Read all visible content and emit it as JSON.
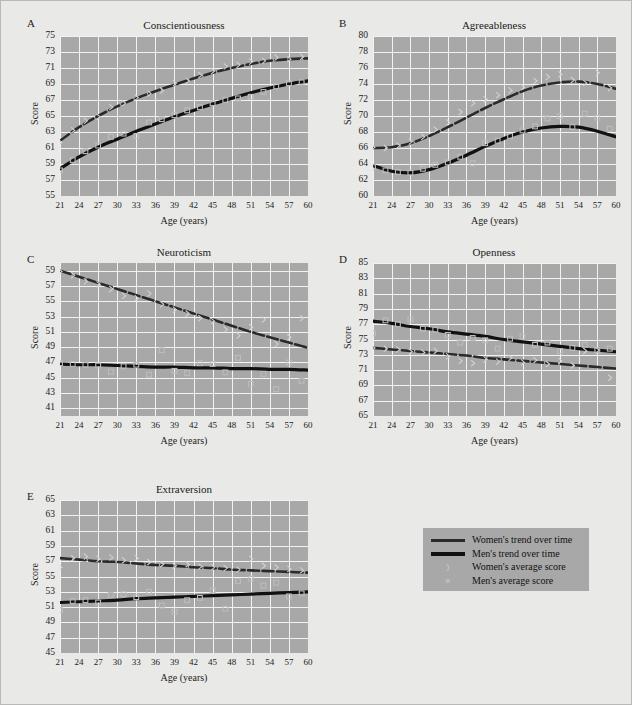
{
  "figure": {
    "background_color": "#e9e9e7",
    "plot_background_color": "#a8a8a8",
    "grid_color": "#f2f2f0",
    "women_color": "#2a2a2a",
    "men_color": "#111111",
    "women_marker_color": "#d2d2d2",
    "men_marker_color": "#bcbcbc"
  },
  "axis_titles": {
    "y": "Score",
    "x": "Age (years)"
  },
  "legend": {
    "entries": [
      {
        "label": "Women's trend over time",
        "type": "line",
        "series": "women"
      },
      {
        "label": "Men's trend over time",
        "type": "line",
        "series": "men"
      },
      {
        "label": "Women's average score",
        "type": "marker",
        "series": "women",
        "glyph": "⟩"
      },
      {
        "label": "Men's average score",
        "type": "marker",
        "series": "men",
        "glyph": "■"
      }
    ]
  },
  "chart_data": [
    {
      "panel": "A",
      "type": "line",
      "title": "Conscientiousness",
      "xlabel": "Age (years)",
      "ylabel": "Score",
      "xlim": [
        21,
        60
      ],
      "ylim": [
        55,
        75
      ],
      "xticks": [
        21,
        24,
        27,
        30,
        33,
        36,
        39,
        42,
        45,
        48,
        51,
        54,
        57,
        60
      ],
      "yticks": [
        55,
        57,
        59,
        61,
        63,
        65,
        67,
        69,
        71,
        73,
        75
      ],
      "grid": true,
      "legend_position": "external",
      "series": [
        {
          "name": "Women's trend over time",
          "x": [
            21,
            24,
            27,
            30,
            33,
            36,
            39,
            42,
            45,
            48,
            51,
            54,
            57,
            60
          ],
          "values": [
            61.9,
            63.6,
            65.0,
            66.2,
            67.2,
            68.1,
            68.9,
            69.7,
            70.4,
            71.0,
            71.5,
            71.9,
            72.1,
            72.2
          ]
        },
        {
          "name": "Men's trend over time",
          "x": [
            21,
            24,
            27,
            30,
            33,
            36,
            39,
            42,
            45,
            48,
            51,
            54,
            57,
            60
          ],
          "values": [
            58.4,
            59.9,
            61.1,
            62.1,
            63.1,
            64.0,
            64.9,
            65.7,
            66.5,
            67.2,
            67.9,
            68.5,
            69.0,
            69.4
          ]
        },
        {
          "name": "Women's average score",
          "marker": "diamond",
          "x": [
            21,
            23,
            25,
            27,
            29,
            31,
            33,
            35,
            37,
            39,
            41,
            43,
            45,
            47,
            49,
            51,
            53,
            55,
            57,
            59
          ],
          "values": [
            61.7,
            63.2,
            64.4,
            64.9,
            66.1,
            66.6,
            67.3,
            67.8,
            68.2,
            69.1,
            69.4,
            70.1,
            70.6,
            71.2,
            71.4,
            71.8,
            71.9,
            72.3,
            72.1,
            72.4
          ]
        },
        {
          "name": "Men's average score",
          "marker": "square",
          "x": [
            21,
            23,
            25,
            27,
            29,
            31,
            33,
            35,
            37,
            39,
            41,
            43,
            45,
            47,
            49,
            51,
            53,
            55,
            57,
            59
          ],
          "values": [
            58.2,
            59.5,
            60.6,
            61.3,
            62.4,
            62.8,
            62.5,
            64.2,
            64.6,
            65.1,
            65.7,
            66.1,
            66.6,
            67.0,
            67.2,
            67.4,
            68.0,
            68.7,
            69.1,
            69.2
          ]
        }
      ]
    },
    {
      "panel": "B",
      "type": "line",
      "title": "Agreeableness",
      "xlabel": "Age (years)",
      "ylabel": "Score",
      "xlim": [
        21,
        60
      ],
      "ylim": [
        60,
        80
      ],
      "xticks": [
        21,
        24,
        27,
        30,
        33,
        36,
        39,
        42,
        45,
        48,
        51,
        54,
        57,
        60
      ],
      "yticks": [
        60,
        62,
        64,
        66,
        68,
        70,
        72,
        74,
        76,
        78,
        80
      ],
      "grid": true,
      "legend_position": "external",
      "series": [
        {
          "name": "Women's trend over time",
          "x": [
            21,
            24,
            27,
            30,
            33,
            36,
            39,
            42,
            45,
            48,
            51,
            54,
            57,
            60
          ],
          "values": [
            66.0,
            66.1,
            66.6,
            67.5,
            68.6,
            69.8,
            71.0,
            72.1,
            73.1,
            73.8,
            74.2,
            74.3,
            74.0,
            73.4
          ]
        },
        {
          "name": "Men's trend over time",
          "x": [
            21,
            24,
            27,
            30,
            33,
            36,
            39,
            42,
            45,
            48,
            51,
            54,
            57,
            60
          ],
          "values": [
            63.8,
            63.1,
            62.9,
            63.3,
            64.1,
            65.1,
            66.2,
            67.2,
            68.0,
            68.5,
            68.7,
            68.6,
            68.1,
            67.4
          ]
        },
        {
          "name": "Women's average score",
          "marker": "diamond",
          "x": [
            21,
            23,
            25,
            27,
            29,
            31,
            33,
            35,
            37,
            39,
            41,
            43,
            45,
            47,
            49,
            51,
            53,
            55,
            57,
            59
          ],
          "values": [
            66.1,
            66.0,
            66.3,
            66.8,
            67.4,
            68.3,
            69.2,
            70.5,
            71.6,
            72.1,
            72.6,
            73.2,
            73.6,
            74.4,
            74.9,
            75.2,
            74.5,
            74.1,
            75.4,
            73.5
          ]
        },
        {
          "name": "Men's average score",
          "marker": "square",
          "x": [
            21,
            23,
            25,
            27,
            29,
            31,
            33,
            35,
            37,
            39,
            41,
            43,
            45,
            47,
            49,
            51,
            53,
            55,
            57,
            59
          ],
          "values": [
            63.6,
            63.2,
            63.0,
            62.9,
            63.4,
            63.9,
            64.2,
            64.9,
            64.1,
            66.6,
            66.9,
            67.5,
            68.2,
            68.7,
            69.7,
            70.0,
            68.6,
            70.3,
            69.8,
            68.4
          ]
        }
      ]
    },
    {
      "panel": "C",
      "type": "line",
      "title": "Neuroticism",
      "xlabel": "Age (years)",
      "ylabel": "Score",
      "xlim": [
        21,
        60
      ],
      "ylim": [
        40,
        60
      ],
      "xticks": [
        21,
        24,
        27,
        30,
        33,
        36,
        39,
        42,
        45,
        48,
        51,
        54,
        57,
        60
      ],
      "yticks": [
        41,
        43,
        45,
        47,
        49,
        51,
        53,
        55,
        57,
        59
      ],
      "grid": true,
      "legend_position": "external",
      "series": [
        {
          "name": "Women's trend over time",
          "x": [
            21,
            24,
            27,
            30,
            33,
            36,
            39,
            42,
            45,
            48,
            51,
            54,
            57,
            60
          ],
          "values": [
            59.0,
            58.2,
            57.4,
            56.6,
            55.8,
            55.0,
            54.2,
            53.4,
            52.6,
            51.8,
            51.0,
            50.3,
            49.6,
            48.9
          ]
        },
        {
          "name": "Men's trend over time",
          "x": [
            21,
            24,
            27,
            30,
            33,
            36,
            39,
            42,
            45,
            48,
            51,
            54,
            57,
            60
          ],
          "values": [
            46.8,
            46.7,
            46.7,
            46.6,
            46.5,
            46.4,
            46.4,
            46.3,
            46.3,
            46.2,
            46.2,
            46.1,
            46.1,
            46.0
          ]
        },
        {
          "name": "Women's average score",
          "marker": "diamond",
          "x": [
            21,
            23,
            25,
            27,
            29,
            31,
            33,
            35,
            37,
            39,
            41,
            43,
            45,
            47,
            49,
            51,
            53,
            55,
            57,
            59
          ],
          "values": [
            58.9,
            58.4,
            57.6,
            57.2,
            56.6,
            55.7,
            55.4,
            56.0,
            54.6,
            53.9,
            53.4,
            52.8,
            52.4,
            51.3,
            50.5,
            51.6,
            52.6,
            49.4,
            50.3,
            52.8
          ]
        },
        {
          "name": "Men's average score",
          "marker": "square",
          "x": [
            21,
            23,
            25,
            27,
            29,
            31,
            33,
            35,
            37,
            39,
            41,
            43,
            45,
            47,
            49,
            51,
            53,
            55,
            57,
            59
          ],
          "values": [
            46.9,
            46.8,
            46.7,
            46.6,
            45.8,
            46.5,
            46.7,
            45.4,
            48.6,
            45.9,
            45.6,
            46.9,
            46.8,
            45.7,
            47.6,
            44.2,
            45.5,
            43.5,
            47.0,
            44.6
          ]
        }
      ]
    },
    {
      "panel": "D",
      "type": "line",
      "title": "Openness",
      "xlabel": "Age (years)",
      "ylabel": "Score",
      "xlim": [
        21,
        60
      ],
      "ylim": [
        65,
        85
      ],
      "xticks": [
        21,
        24,
        27,
        30,
        33,
        36,
        39,
        42,
        45,
        48,
        51,
        54,
        57,
        60
      ],
      "yticks": [
        65,
        67,
        69,
        71,
        73,
        75,
        77,
        79,
        81,
        83,
        85
      ],
      "grid": true,
      "legend_position": "external",
      "series": [
        {
          "name": "Women's trend over time",
          "x": [
            21,
            24,
            27,
            30,
            33,
            36,
            39,
            42,
            45,
            48,
            51,
            54,
            57,
            60
          ],
          "values": [
            73.9,
            73.7,
            73.5,
            73.3,
            73.1,
            72.9,
            72.6,
            72.4,
            72.2,
            72.0,
            71.8,
            71.6,
            71.4,
            71.2
          ]
        },
        {
          "name": "Men's trend over time",
          "x": [
            21,
            24,
            27,
            30,
            33,
            36,
            39,
            42,
            45,
            48,
            51,
            54,
            57,
            60
          ],
          "values": [
            77.4,
            77.1,
            76.7,
            76.4,
            76.0,
            75.7,
            75.4,
            75.0,
            74.7,
            74.4,
            74.1,
            73.8,
            73.6,
            73.4
          ]
        },
        {
          "name": "Women's average score",
          "marker": "diamond",
          "x": [
            21,
            23,
            25,
            27,
            29,
            31,
            33,
            35,
            37,
            39,
            41,
            43,
            45,
            47,
            49,
            51,
            53,
            55,
            57,
            59
          ],
          "values": [
            73.9,
            73.8,
            73.7,
            73.4,
            73.3,
            73.5,
            72.8,
            72.2,
            71.9,
            72.4,
            72.1,
            72.6,
            72.0,
            72.3,
            71.8,
            72.2,
            71.6,
            73.5,
            73.6,
            70.0
          ]
        },
        {
          "name": "Men's average score",
          "marker": "square",
          "x": [
            21,
            23,
            25,
            27,
            29,
            31,
            33,
            35,
            37,
            39,
            41,
            43,
            45,
            47,
            49,
            51,
            53,
            55,
            57,
            59
          ],
          "values": [
            75.8,
            77.5,
            77.0,
            77.6,
            76.4,
            76.3,
            75.6,
            74.6,
            75.2,
            74.9,
            73.8,
            75.1,
            75.4,
            74.3,
            74.6,
            73.5,
            73.9,
            74.3,
            73.6,
            73.8
          ]
        }
      ]
    },
    {
      "panel": "E",
      "type": "line",
      "title": "Extraversion",
      "xlabel": "Age (years)",
      "ylabel": "Score",
      "xlim": [
        21,
        60
      ],
      "ylim": [
        45,
        65
      ],
      "xticks": [
        21,
        24,
        27,
        30,
        33,
        36,
        39,
        42,
        45,
        48,
        51,
        54,
        57,
        60
      ],
      "yticks": [
        45,
        47,
        49,
        51,
        53,
        55,
        57,
        59,
        61,
        63,
        65
      ],
      "grid": true,
      "legend_position": "external",
      "series": [
        {
          "name": "Women's trend over time",
          "x": [
            21,
            24,
            27,
            30,
            33,
            36,
            39,
            42,
            45,
            48,
            51,
            54,
            57,
            60
          ],
          "values": [
            57.4,
            57.2,
            57.0,
            56.9,
            56.7,
            56.5,
            56.4,
            56.2,
            56.1,
            55.9,
            55.8,
            55.7,
            55.6,
            55.5
          ]
        },
        {
          "name": "Men's trend over time",
          "x": [
            21,
            24,
            27,
            30,
            33,
            36,
            39,
            42,
            45,
            48,
            51,
            54,
            57,
            60
          ],
          "values": [
            51.6,
            51.7,
            51.8,
            51.9,
            52.1,
            52.2,
            52.3,
            52.4,
            52.5,
            52.6,
            52.7,
            52.8,
            52.9,
            53.0
          ]
        },
        {
          "name": "Women's average score",
          "marker": "diamond",
          "x": [
            21,
            23,
            25,
            27,
            29,
            31,
            33,
            35,
            37,
            39,
            41,
            43,
            45,
            47,
            49,
            51,
            53,
            55,
            57,
            59
          ],
          "values": [
            56.2,
            57.4,
            57.6,
            57.3,
            57.5,
            57.1,
            57.4,
            56.9,
            56.6,
            56.4,
            56.6,
            56.3,
            56.2,
            56.1,
            55.9,
            57.3,
            56.4,
            56.2,
            56.0,
            55.8
          ]
        },
        {
          "name": "Men's average score",
          "marker": "square",
          "x": [
            21,
            23,
            25,
            27,
            29,
            31,
            33,
            35,
            37,
            39,
            41,
            43,
            45,
            47,
            49,
            51,
            53,
            55,
            57,
            59
          ],
          "values": [
            50.6,
            51.8,
            51.9,
            51.6,
            52.6,
            52.7,
            52.3,
            53.0,
            51.2,
            50.4,
            51.9,
            52.2,
            53.2,
            50.8,
            54.4,
            54.7,
            53.8,
            54.2,
            52.4,
            52.8
          ]
        }
      ]
    }
  ]
}
